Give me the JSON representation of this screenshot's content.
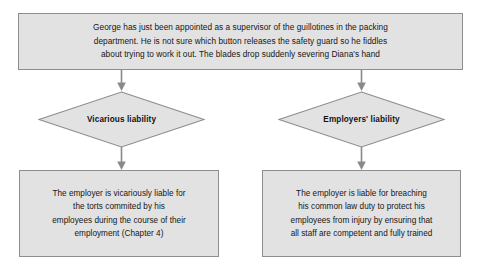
{
  "diagram": {
    "type": "flowchart",
    "nodes": {
      "scenario": {
        "shape": "rectangle",
        "text": "George has just been appointed as a supervisor of the guillotines in the packing\ndepartment. He is not sure which button releases the safety guard so he fiddles\nabout trying to work it out. The blades drop suddenly severing Diana's hand"
      },
      "decision_left": {
        "shape": "diamond",
        "label": "Vicarious liability"
      },
      "decision_right": {
        "shape": "diamond",
        "label": "Employers' liability"
      },
      "outcome_left": {
        "shape": "rectangle",
        "text": "The employer is vicariously liable for\nthe torts commited by his\nemployees during the course of their\nemployment (Chapter 4)"
      },
      "outcome_right": {
        "shape": "rectangle",
        "text": "The employer is liable for breaching\nhis common law duty to protect his\nemployees from injury by ensuring that\nall staff are competent and fully trained"
      }
    },
    "connectors": [
      {
        "name": "scenario-to-vicarious",
        "from": "scenario",
        "to": "decision_left",
        "style": "arrow-down"
      },
      {
        "name": "scenario-to-employers",
        "from": "scenario",
        "to": "decision_right",
        "style": "arrow-down"
      },
      {
        "name": "vicarious-to-outcome",
        "from": "decision_left",
        "to": "outcome_left",
        "style": "arrow-down"
      },
      {
        "name": "employers-to-outcome",
        "from": "decision_right",
        "to": "outcome_right",
        "style": "arrow-down"
      }
    ],
    "colors": {
      "shape_fill": "#e2e2e2",
      "shape_border": "#8e8e8e",
      "text": "#161616",
      "connector": "#8a8a8a",
      "background": "#ffffff"
    }
  }
}
